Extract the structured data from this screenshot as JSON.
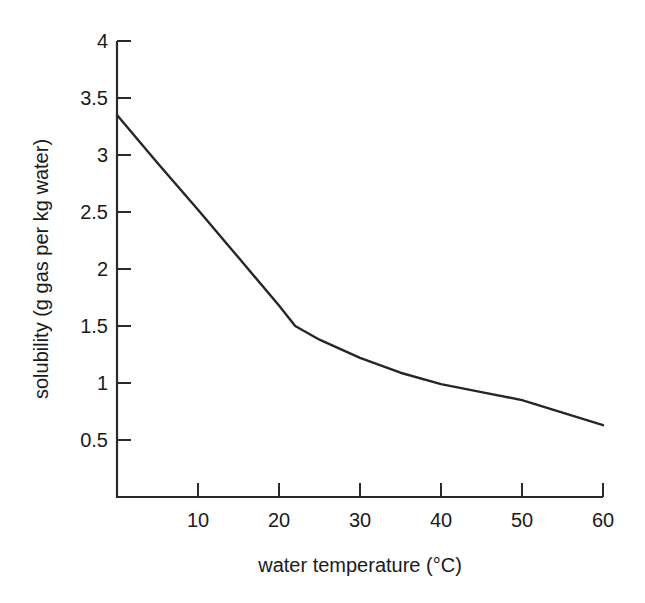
{
  "top_fragment": {
    "text": "clipped running-head text (illegible)"
  },
  "figure": {
    "background_color": "#ffffff",
    "line_color": "#262626",
    "axis_color": "#2a2a2a"
  },
  "chart_data": {
    "type": "line",
    "title": "",
    "subtitle": "",
    "xlabel": "water temperature (°C)",
    "ylabel": "solubility (g gas per kg water)",
    "xlim": [
      0,
      60
    ],
    "ylim": [
      0,
      4
    ],
    "grid": false,
    "legend": false,
    "legend_position": "none",
    "xticks": [
      10,
      20,
      30,
      40,
      50,
      60
    ],
    "xtick_labels": [
      "10",
      "20",
      "30",
      "40",
      "50",
      "60"
    ],
    "yticks": [
      0.5,
      1,
      1.5,
      2,
      2.5,
      3,
      3.5,
      4
    ],
    "ytick_labels": [
      "0.5",
      "1",
      "1.5",
      "2",
      "2.5",
      "3",
      "3.5",
      "4"
    ],
    "tick_direction": "in",
    "spines_visible": [
      "left",
      "bottom"
    ],
    "series": [
      {
        "name": "gas solubility",
        "x": [
          0,
          5,
          10,
          15,
          20,
          22,
          25,
          30,
          35,
          40,
          45,
          50,
          55,
          60
        ],
        "y": [
          3.35,
          2.93,
          2.52,
          2.1,
          1.68,
          1.5,
          1.38,
          1.22,
          1.09,
          0.99,
          0.92,
          0.85,
          0.74,
          0.63
        ]
      }
    ],
    "annotations": []
  }
}
